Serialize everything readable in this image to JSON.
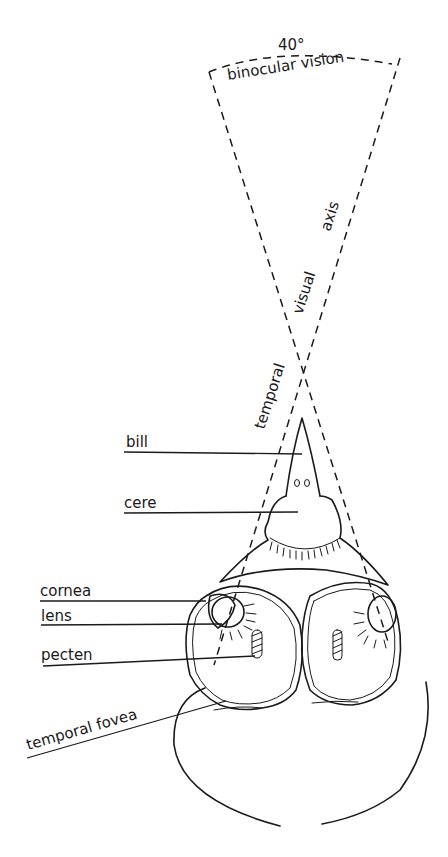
{
  "figure": {
    "angle_label": "40°",
    "field_label": "binocular vision",
    "axis_labels": {
      "temporal": "temporal",
      "visual": "visual",
      "axis": "axis"
    },
    "labels": [
      {
        "id": "bill",
        "text": "bill"
      },
      {
        "id": "cere",
        "text": "cere"
      },
      {
        "id": "cornea",
        "text": "cornea"
      },
      {
        "id": "lens",
        "text": "lens"
      },
      {
        "id": "pecten",
        "text": "pecten"
      },
      {
        "id": "temporal-fovea",
        "text": "temporal fovea"
      }
    ],
    "colors": {
      "ink": "#1a1a1a",
      "paper": "#ffffff"
    }
  }
}
